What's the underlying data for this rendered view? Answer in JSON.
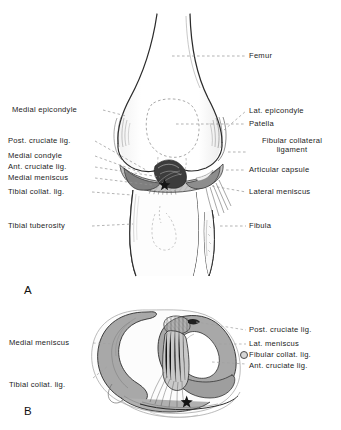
{
  "figure": {
    "panels": [
      {
        "letter": "A",
        "caption_role": "anterior-view-knee"
      },
      {
        "letter": "B",
        "caption_role": "superior-view-tibial-plateau"
      }
    ]
  },
  "panel_a": {
    "letter": "A",
    "labels_left": [
      {
        "key": "medial_epicondyle",
        "text": "Medial epicondyle"
      },
      {
        "key": "post_cruciate_lig",
        "text": "Post. cruciate lig."
      },
      {
        "key": "medial_condyle",
        "text": "Medial condyle"
      },
      {
        "key": "ant_cruciate_lig",
        "text": "Ant. cruciate lig."
      },
      {
        "key": "medial_meniscus",
        "text": "Medial meniscus"
      },
      {
        "key": "tibial_collat_lig",
        "text": "Tibial collat. lig."
      },
      {
        "key": "tibial_tuberosity",
        "text": "Tibial tuberosity"
      }
    ],
    "labels_right": [
      {
        "key": "femur",
        "text": "Femur"
      },
      {
        "key": "lat_epicondyle",
        "text": "Lat. epicondyle"
      },
      {
        "key": "patella",
        "text": "Patella"
      },
      {
        "key": "fibular_collateral_ligament",
        "text": "Fibular collateral ligament"
      },
      {
        "key": "articular_capsule",
        "text": "Articular capsule"
      },
      {
        "key": "lateral_meniscus",
        "text": "Lateral meniscus"
      },
      {
        "key": "fibula",
        "text": "Fibula"
      }
    ]
  },
  "panel_b": {
    "letter": "B",
    "labels_left": [
      {
        "key": "medial_meniscus",
        "text": "Medial meniscus"
      },
      {
        "key": "tibial_collat_lig",
        "text": "Tibial collat. lig."
      }
    ],
    "labels_right": [
      {
        "key": "post_cruciate_lig",
        "text": "Post. cruciate lig."
      },
      {
        "key": "lat_meniscus",
        "text": "Lat. meniscus"
      },
      {
        "key": "fibular_collat_lig",
        "text": "Fibular collat. lig."
      },
      {
        "key": "ant_cruciate_lig",
        "text": "Ant. cruciate lig."
      }
    ]
  },
  "colors": {
    "background": "#ffffff",
    "ink": "#1c1c1c",
    "outline": "#2b2b2b",
    "leader": "#8d8d8d",
    "meniscus_fill": "#a8a8a8",
    "meniscus_fill_dark": "#8e8e8e",
    "capsule_fill": "#bdbdbd",
    "bone_fill": "#fdfdfd",
    "hatch": "#5a5a5a"
  }
}
